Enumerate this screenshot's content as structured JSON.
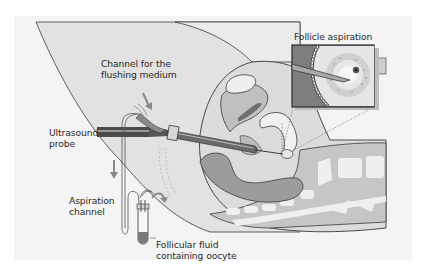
{
  "figure": {
    "title": "Follicle aspiration"
  },
  "labels": {
    "flushing_channel": "Channel for the\nflushing medium",
    "ultrasound_probe": "Ultrasound\nprobe",
    "aspiration_channel": "Aspiration\nchannel",
    "follicular_fluid": "Follicular fluid\ncontaining oocyte",
    "inset_title": "Follicle aspiration"
  },
  "colors": {
    "panel_bg": "#f4f4f4",
    "body_outline": "#3a3a3a",
    "skin_light": "#e4e4e4",
    "tissue_mid": "#c8c8c8",
    "tissue_dark": "#9a9a9a",
    "organ_dark": "#8a8a8a",
    "bone": "#f0f0f0",
    "probe": "#444444",
    "fluid": "#7a7a7a",
    "arrow": "#888888"
  }
}
